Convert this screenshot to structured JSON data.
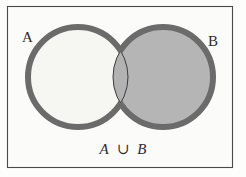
{
  "figure": {
    "canvas": {
      "width": 246,
      "height": 177
    },
    "background_color": "#fdfdfc",
    "frame": {
      "name": "outer-frame",
      "x": 7,
      "y": 6,
      "width": 226,
      "height": 162,
      "stroke_color": "#4a4a4a",
      "fill_color": "#fbfbfa",
      "stroke_width": 1.1
    }
  },
  "diagram": {
    "type": "venn-2-set",
    "shaded_region": "union",
    "stroke_color": "#6b6b6b",
    "stroke_width": 6,
    "inner_line_color": "#3c3c3c",
    "inner_line_width": 1,
    "circles": [
      {
        "id": "set-a",
        "label": "A",
        "cx": 78,
        "cy": 77,
        "r": 50,
        "fill_color": "#f6f6f3"
      },
      {
        "id": "set-b",
        "label": "B",
        "cx": 163,
        "cy": 77,
        "r": 50,
        "fill_color": "#b5b5b5"
      }
    ],
    "overlap": {
      "id": "intersection-lens",
      "fill_color": "#b2b2b2"
    }
  },
  "labels": {
    "set_a": {
      "text": "A",
      "x": 22,
      "y": 42
    },
    "set_b": {
      "text": "B",
      "x": 208,
      "y": 46
    }
  },
  "caption": {
    "name": "union-caption",
    "full_text": "A ∪ B",
    "left_operand": "A",
    "operator": "∪",
    "right_operand": "B",
    "x": 123,
    "y": 154
  }
}
